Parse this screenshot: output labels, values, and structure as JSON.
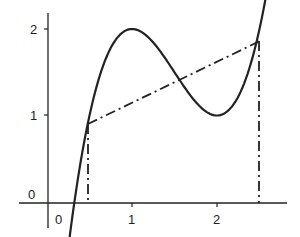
{
  "chart_data": {
    "type": "line",
    "title": "",
    "xlabel": "",
    "ylabel": "",
    "x_ticks": [
      "0",
      "1",
      "2"
    ],
    "y_ticks": [
      "0",
      "1",
      "2"
    ],
    "xlim": [
      -0.1,
      3.0
    ],
    "ylim": [
      -0.4,
      2.2
    ],
    "grid": false,
    "series": [
      {
        "name": "f(x)",
        "style": "solid",
        "function": "2x^3 - 9x^2 + 12x - 3",
        "x": [
          0.3,
          0.5,
          0.75,
          1.0,
          1.25,
          1.5,
          1.75,
          2.0,
          2.25,
          2.5,
          2.65
        ],
        "y": [
          -0.16,
          1.0,
          1.78,
          2.0,
          1.84,
          1.5,
          1.16,
          1.0,
          1.16,
          2.0,
          2.6
        ]
      },
      {
        "name": "secant",
        "style": "dash-dot",
        "x": [
          0.48,
          2.5
        ],
        "y": [
          0.9,
          1.85
        ]
      },
      {
        "name": "vertical-left",
        "style": "dash-dot",
        "x": [
          0.48,
          0.48
        ],
        "y": [
          0,
          0.9
        ]
      },
      {
        "name": "vertical-right",
        "style": "dash-dot",
        "x": [
          2.5,
          2.5
        ],
        "y": [
          0,
          1.85
        ]
      }
    ]
  },
  "labels": {
    "y0": "0",
    "y1": "1",
    "y2": "2",
    "x0": "0",
    "x1": "1",
    "x2": "2"
  }
}
